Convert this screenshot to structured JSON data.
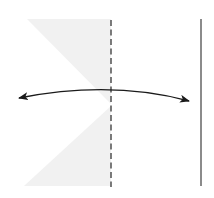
{
  "diagram": {
    "type": "fold-instruction",
    "background": "#ffffff",
    "shade_color": "#f0f0f0",
    "line_color": "#5a5a5a",
    "arrow_color": "#1a1a1a",
    "elements": {
      "upper_flap": {
        "points": [
          [
            27,
            19
          ],
          [
            111,
            19
          ],
          [
            111,
            104
          ]
        ]
      },
      "lower_flap": {
        "points": [
          [
            111,
            106
          ],
          [
            24,
            186
          ],
          [
            111,
            186
          ]
        ]
      },
      "valley_fold_line": {
        "x": 111,
        "y1": 20,
        "y2": 187,
        "style": "dashed"
      },
      "edge_line": {
        "x": 201,
        "y1": 19,
        "y2": 186,
        "style": "solid"
      },
      "fold_arrow": {
        "from": [
          19,
          98
        ],
        "apex": [
          111,
          90
        ],
        "to": [
          189,
          101
        ],
        "heads": "both"
      }
    }
  }
}
